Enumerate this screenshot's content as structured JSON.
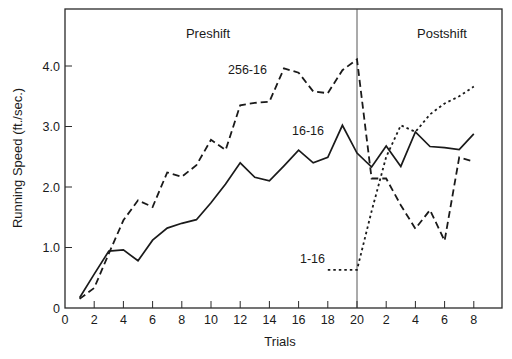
{
  "chart_data": {
    "type": "line",
    "title": "",
    "xlabel": "Trials",
    "ylabel": "Running Speed (ft./sec.)",
    "ylim": [
      0,
      4.5
    ],
    "yticks": [
      {
        "value": 0,
        "label": "0"
      },
      {
        "value": 1.0,
        "label": "1.0"
      },
      {
        "value": 2.0,
        "label": "2.0"
      },
      {
        "value": 3.0,
        "label": "3.0"
      },
      {
        "value": 4.0,
        "label": "4.0"
      }
    ],
    "xticks_preshift": [
      "0",
      "2",
      "4",
      "6",
      "8",
      "10",
      "12",
      "14",
      "16",
      "18",
      "20"
    ],
    "xticks_postshift": [
      "2",
      "4",
      "6",
      "8"
    ],
    "phases": [
      {
        "name": "Preshift",
        "trials": [
          1,
          20
        ]
      },
      {
        "name": "Postshift",
        "trials": [
          1,
          8
        ]
      }
    ],
    "grid": false,
    "legend": "inline labels",
    "series": [
      {
        "name": "256-16",
        "style": "dashed",
        "preshift": {
          "x": [
            1,
            2,
            3,
            4,
            5,
            6,
            7,
            8,
            9,
            10,
            11,
            12,
            13,
            14,
            15,
            16,
            17,
            18,
            19,
            20
          ],
          "values": [
            0.15,
            0.33,
            0.9,
            1.45,
            1.78,
            1.67,
            2.24,
            2.17,
            2.36,
            2.78,
            2.61,
            3.35,
            3.39,
            3.41,
            3.96,
            3.89,
            3.58,
            3.55,
            3.93,
            4.11
          ]
        },
        "postshift": {
          "x": [
            1,
            2,
            3,
            4,
            5,
            6,
            7,
            8
          ],
          "values": [
            2.14,
            2.14,
            1.7,
            1.31,
            1.62,
            1.11,
            2.49,
            2.42
          ]
        }
      },
      {
        "name": "16-16",
        "style": "solid",
        "preshift": {
          "x": [
            1,
            2,
            3,
            4,
            5,
            6,
            7,
            8,
            9,
            10,
            11,
            12,
            13,
            14,
            15,
            16,
            17,
            18,
            19,
            20
          ],
          "values": [
            0.17,
            0.56,
            0.94,
            0.96,
            0.78,
            1.12,
            1.32,
            1.4,
            1.46,
            1.74,
            2.05,
            2.4,
            2.16,
            2.1,
            2.35,
            2.61,
            2.4,
            2.49,
            3.02,
            2.56
          ]
        },
        "postshift": {
          "x": [
            1,
            2,
            3,
            4,
            5,
            6,
            7,
            8
          ],
          "values": [
            2.33,
            2.68,
            2.34,
            2.91,
            2.67,
            2.65,
            2.62,
            2.88
          ]
        }
      },
      {
        "name": "1-16",
        "style": "dotted",
        "preshift": {
          "x": [
            18,
            19,
            20
          ],
          "values": [
            0.63,
            0.63,
            0.63
          ]
        },
        "postshift": {
          "x": [
            1,
            2,
            3,
            4,
            5,
            6,
            7,
            8
          ],
          "values": [
            1.6,
            2.5,
            3.02,
            2.91,
            3.2,
            3.38,
            3.5,
            3.66
          ]
        }
      }
    ]
  },
  "labels": {
    "preshift": "Preshift",
    "postshift": "Postshift",
    "series_256": "256-16",
    "series_16": "16-16",
    "series_1": "1-16",
    "xlabel": "Trials",
    "ylabel": "Running Speed (ft./sec.)"
  }
}
